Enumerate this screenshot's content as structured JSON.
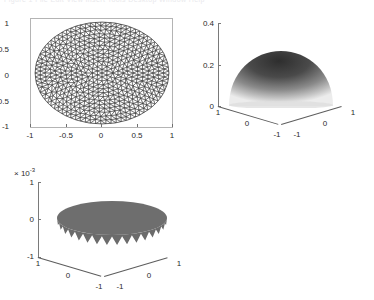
{
  "figure": {
    "background": "#ffffff",
    "clipped_header_text": "Figure 1   File  Edit  View  Insert  Tools  Desktop  Window  Help"
  },
  "chart_data": [
    {
      "id": "mesh-plot",
      "type": "scatter",
      "title": "",
      "xlabel": "",
      "ylabel": "",
      "xlim": [
        -1,
        1
      ],
      "ylim": [
        -1,
        1
      ],
      "xticks": [
        "-1",
        "-0.5",
        "0",
        "0.5",
        "1"
      ],
      "xtick_values": [
        -1,
        -0.5,
        0,
        0.5,
        1
      ],
      "yticks": [
        "1",
        "0.5",
        "0",
        "-0.5",
        "-1"
      ],
      "ytick_values": [
        1,
        0.5,
        0,
        -0.5,
        -1
      ],
      "grid": false,
      "legend": "none",
      "description": "Unstructured triangular finite element mesh filling an elliptical/circular domain of unit radius",
      "mesh": {
        "domain_shape": "ellipse",
        "radius_x": 1.0,
        "radius_y": 1.0,
        "edge_color": "#3c3c3c",
        "face_color": "#ffffff",
        "approx_triangles": 900,
        "approx_nodes": 480
      }
    },
    {
      "id": "solution-surface",
      "type": "surface",
      "title": "",
      "xlabel": "",
      "ylabel": "",
      "zlabel": "",
      "xlim": [
        -1,
        1
      ],
      "ylim": [
        -1,
        1
      ],
      "zlim": [
        0,
        0.4
      ],
      "zticks": [
        "0",
        "0.2",
        "0.4"
      ],
      "ztick_values": [
        0,
        0.2,
        0.4
      ],
      "xticks": [
        "-1",
        "0",
        "1"
      ],
      "xtick_values": [
        -1,
        0,
        1
      ],
      "yticks": [
        "1",
        "0",
        "-1"
      ],
      "ytick_values": [
        1,
        0,
        -1
      ],
      "grid": false,
      "legend": "none",
      "colormap": "gray",
      "description": "Dome-shaped numerical solution surface over the unit disk, peak value approximately 0.25",
      "peak_value": 0.25,
      "boundary_value": 0.0
    },
    {
      "id": "error-surface",
      "type": "surface",
      "title": "",
      "xlabel": "",
      "ylabel": "",
      "zlabel": "",
      "exponent_label": "10",
      "exponent_power": "-3",
      "exponent_prefix": "×",
      "xlim": [
        -1,
        1
      ],
      "ylim": [
        -1,
        1
      ],
      "zlim": [
        -1,
        1
      ],
      "z_scale": 0.001,
      "zticks": [
        "1",
        "0",
        "-1"
      ],
      "ztick_values": [
        1,
        0,
        -1
      ],
      "xticks": [
        "-1",
        "0",
        "1"
      ],
      "xtick_values": [
        -1,
        0,
        1
      ],
      "yticks": [
        "1",
        "0",
        "-1"
      ],
      "ytick_values": [
        1,
        0,
        -1
      ],
      "grid": false,
      "legend": "none",
      "colormap": "gray",
      "description": "Nearly flat error surface over the unit disk with jagged spikes near the boundary, magnitude on the order of 1e-3",
      "face_color": "#6e6e6e"
    }
  ]
}
